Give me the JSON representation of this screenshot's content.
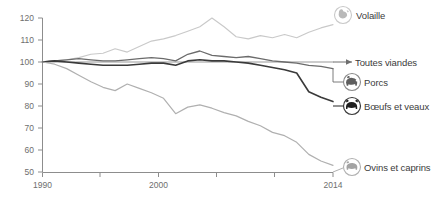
{
  "chart_data": {
    "type": "line",
    "title": "",
    "subtitle": "",
    "xlabel": "",
    "ylabel": "",
    "xlim": [
      1990,
      2014
    ],
    "ylim": [
      50,
      120
    ],
    "grid": false,
    "legend_position": "right-inline",
    "x": [
      1990,
      1991,
      1992,
      1993,
      1994,
      1995,
      1996,
      1997,
      1998,
      1999,
      2000,
      2001,
      2002,
      2003,
      2004,
      2005,
      2006,
      2007,
      2008,
      2009,
      2010,
      2011,
      2012,
      2013,
      2014
    ],
    "y_ticks": [
      50,
      60,
      70,
      80,
      90,
      100,
      110,
      120
    ],
    "x_ticks": [
      1990,
      1995,
      2000,
      2005,
      2010,
      2014
    ],
    "x_tick_labels": [
      "1990",
      "",
      "2000",
      "",
      "",
      "2014"
    ],
    "series": [
      {
        "name": "Volaille",
        "icon": "chicken-icon",
        "color": "#c9c9c9",
        "width": 1.1,
        "values": [
          100,
          100.5,
          101,
          102,
          103.5,
          104,
          106,
          104.5,
          107,
          109.5,
          110.5,
          112,
          114,
          116,
          120,
          116,
          111.5,
          110.5,
          112,
          111,
          112.5,
          111,
          113.5,
          115.5,
          117
        ]
      },
      {
        "name": "Toutes viandes",
        "icon": "arrow-icon",
        "color": "#9a9a9a",
        "width": 1.1,
        "values": [
          100,
          100,
          100,
          100,
          100,
          100,
          100,
          100,
          100,
          100,
          100,
          100,
          100,
          100,
          100,
          100,
          100,
          100,
          100,
          100,
          100,
          100,
          100,
          100,
          100
        ]
      },
      {
        "name": "Porcs",
        "icon": "pig-icon",
        "color": "#6b6b6b",
        "width": 1.3,
        "values": [
          100,
          100.5,
          101,
          101.5,
          101,
          100.5,
          100.5,
          101,
          101.5,
          102,
          101.5,
          100.5,
          103.5,
          105,
          103,
          102.5,
          102,
          102.5,
          101.5,
          100.5,
          100,
          99.5,
          98.5,
          98,
          97
        ]
      },
      {
        "name": "Bœufs et veaux",
        "icon": "cow-icon",
        "color": "#3a3a3a",
        "width": 1.6,
        "values": [
          100,
          100.5,
          100,
          99.5,
          99,
          98.5,
          98.5,
          98.5,
          99,
          99.5,
          99.5,
          98.5,
          100.5,
          101,
          100.5,
          100.5,
          100,
          99.5,
          98.5,
          97.5,
          96.5,
          95,
          86.5,
          84,
          82
        ]
      },
      {
        "name": "Ovins et caprins",
        "icon": "sheep-icon",
        "color": "#b0b0b0",
        "width": 1.2,
        "values": [
          100,
          99,
          97,
          94,
          91,
          88.5,
          87,
          90,
          88,
          86,
          83.5,
          76.5,
          79.5,
          80.5,
          79,
          77,
          75.5,
          73,
          71,
          68,
          66.5,
          63.5,
          58,
          55,
          53
        ]
      }
    ]
  },
  "legend": [
    {
      "label": "Volaille",
      "icon": "chicken-icon"
    },
    {
      "label": "Toutes viandes",
      "icon": "arrow-icon"
    },
    {
      "label": "Porcs",
      "icon": "pig-icon"
    },
    {
      "label": "Bœufs et veaux",
      "icon": "cow-icon"
    },
    {
      "label": "Ovins et caprins",
      "icon": "sheep-icon"
    }
  ],
  "axis": {
    "y_labels": [
      "120",
      "110",
      "100",
      "90",
      "80",
      "70",
      "60",
      "50"
    ],
    "x_labels": [
      "1990",
      "2000",
      "2014"
    ]
  },
  "colors": {
    "axis": "#8d8d8d",
    "tick_text": "#6e6e6e",
    "legend_text": "#3b3b3b",
    "background": "#ffffff"
  }
}
